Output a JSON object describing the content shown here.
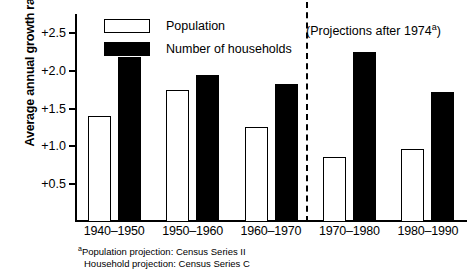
{
  "chart_data": {
    "type": "bar",
    "title": "",
    "subtitle": "",
    "xlabel": "",
    "ylabel": "Average annual growth rate",
    "ylim": [
      0,
      2.75
    ],
    "yticks": [
      "+0.5",
      "+1.0",
      "+1.5",
      "+2.0",
      "+2.5"
    ],
    "ytick_values": [
      0.5,
      1.0,
      1.5,
      2.0,
      2.5
    ],
    "grid": false,
    "legend_position": "top-left-inside",
    "categories": [
      "1940–1950",
      "1950–1960",
      "1960–1970",
      "1970–1980",
      "1980–1990"
    ],
    "series": [
      {
        "name": "Population",
        "color": "#ffffff",
        "edgecolor": "#000000",
        "values": [
          1.4,
          1.75,
          1.26,
          0.86,
          0.97
        ]
      },
      {
        "name": "Number of households",
        "color": "#000000",
        "edgecolor": "#000000",
        "values": [
          2.18,
          1.94,
          1.82,
          2.25,
          1.72
        ]
      }
    ],
    "annotations": [
      {
        "name": "projection-divider",
        "type": "vline",
        "style": "dashed",
        "after_category": "1960–1970"
      },
      {
        "name": "projection-note",
        "type": "text",
        "text": "(Projections after 1974",
        "superscript": "a",
        "text_tail": ")"
      }
    ]
  },
  "legend": {
    "items": [
      {
        "label": "Population",
        "swatch": "white-outlined-rect"
      },
      {
        "label": "Number of households",
        "swatch": "solid-black-rect"
      }
    ]
  },
  "axis": {
    "y_title": "Average annual growth rate",
    "y_ticks": [
      {
        "label": "+2.5",
        "value": 2.5
      },
      {
        "label": "+2.0",
        "value": 2.0
      },
      {
        "label": "+1.5",
        "value": 1.5
      },
      {
        "label": "+1.0",
        "value": 1.0
      },
      {
        "label": "+0.5",
        "value": 0.5
      }
    ],
    "x_labels": [
      "1940–1950",
      "1950–1960",
      "1960–1970",
      "1970–1980",
      "1980–1990"
    ]
  },
  "projection_note": {
    "prefix": "(Projections after 1974",
    "superscript": "a",
    "suffix": ")"
  },
  "footnote": {
    "marker": "a",
    "line1": "Population projection: Census Series II",
    "line2": "Household projection: Census Series C"
  }
}
